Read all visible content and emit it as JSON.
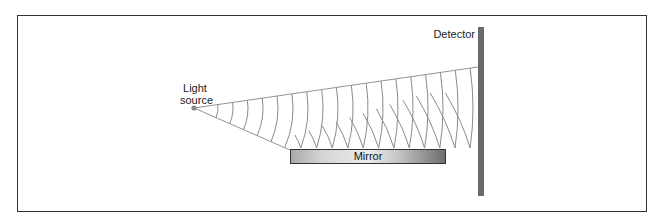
{
  "diagram": {
    "labels": {
      "light_source": "Light\nsource",
      "light_source_line1": "Light",
      "light_source_line2": "source",
      "mirror": "Mirror",
      "detector": "Detector"
    },
    "colors": {
      "frame": "#333333",
      "rays": "#777777",
      "wavefronts": "#8a8a8a",
      "source_dot": "#888888",
      "detector": "#6a6a6a",
      "mirror_dark": "#6e6e6e",
      "mirror_light": "#ececec"
    },
    "geometry": {
      "source": [
        194,
        108
      ],
      "upper_ray_end": [
        478,
        67
      ],
      "lower_ray_end": [
        290,
        150
      ],
      "mirror": {
        "x": 290,
        "y": 149,
        "w": 156,
        "h": 15
      },
      "detector": {
        "x": 478,
        "y": 27,
        "w": 6,
        "h": 169
      }
    }
  }
}
